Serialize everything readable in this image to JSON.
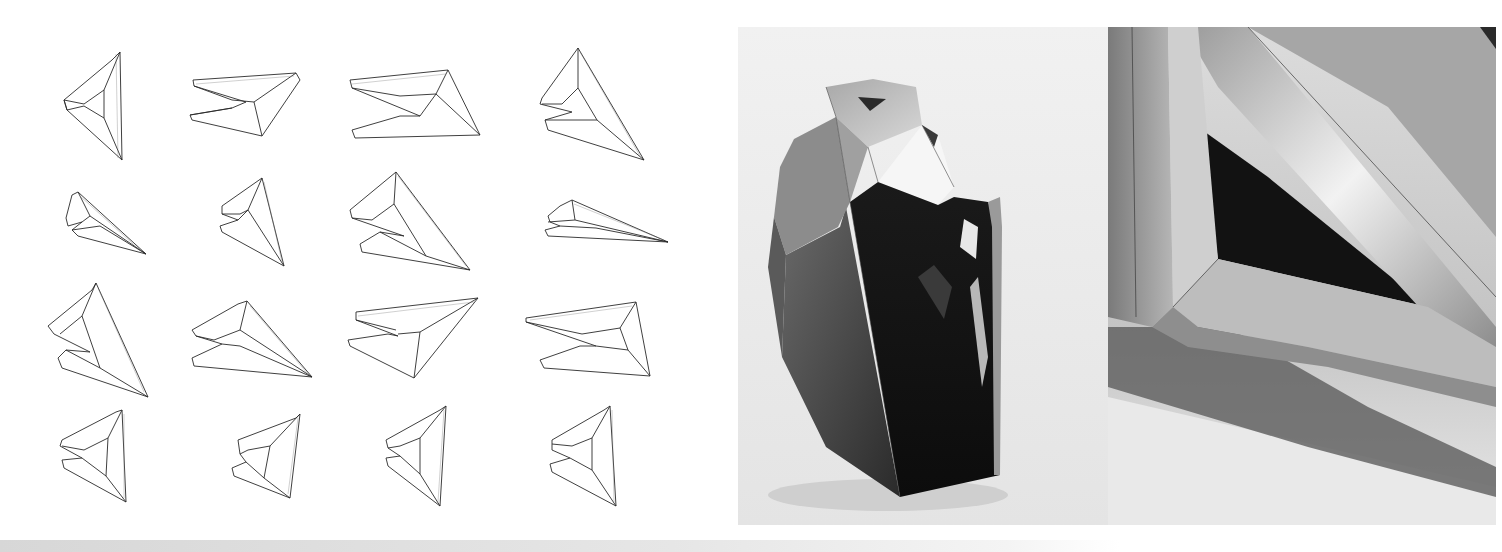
{
  "page": {
    "type": "architecture-model-spread",
    "background": "#ffffff"
  },
  "drawings": {
    "label": "folded-module-line-drawings",
    "grid": {
      "rows": 4,
      "cols": 4,
      "count": 16
    },
    "stroke_color": "#222222"
  },
  "photos": [
    {
      "label": "folded-metal-pod-model-photo",
      "tone": "grayscale"
    },
    {
      "label": "folded-metal-detail-closeup-photo",
      "tone": "grayscale"
    }
  ]
}
